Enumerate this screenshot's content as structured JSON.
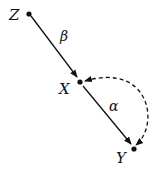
{
  "diagram": {
    "type": "causal-graph",
    "nodes": [
      {
        "id": "Z",
        "label": "Z"
      },
      {
        "id": "X",
        "label": "X"
      },
      {
        "id": "Y",
        "label": "Y"
      }
    ],
    "edges": [
      {
        "from": "Z",
        "to": "X",
        "label": "β",
        "style": "solid"
      },
      {
        "from": "X",
        "to": "Y",
        "label": "α",
        "style": "solid"
      },
      {
        "from": "X",
        "to": "Y",
        "label": "",
        "style": "dashed-bidirected"
      }
    ],
    "colors": {
      "stroke": "#111111",
      "background": "#ffffff"
    }
  }
}
